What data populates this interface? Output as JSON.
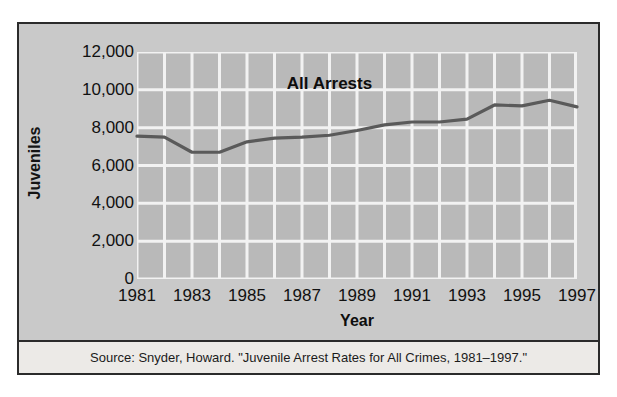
{
  "figure": {
    "series_label": "All Arrests",
    "y_axis_title": "Juveniles",
    "x_axis_title": "Year",
    "source_note": "Source: Snyder, Howard. \"Juvenile Arrest Rates for All Crimes, 1981–1997.\"",
    "colors": {
      "panel_background": "#c9c9c9",
      "plot_background": "#b9b9b9",
      "gridline": "#f2f2f2",
      "line": "#5a5a5a",
      "frame_border": "#2b2b2b",
      "caption_background": "#eceae7",
      "text": "#111111"
    }
  },
  "chart_data": {
    "type": "line",
    "title": "",
    "subtitle": "",
    "xlabel": "Year",
    "ylabel": "Juveniles",
    "xlim": [
      1981,
      1997
    ],
    "ylim": [
      0,
      12000
    ],
    "grid": true,
    "legend_position": "inline-annotation",
    "y_ticks": [
      0,
      2000,
      4000,
      6000,
      8000,
      10000,
      12000
    ],
    "y_tick_labels": [
      "0",
      "2,000",
      "4,000",
      "6,000",
      "8,000",
      "10,000",
      "12,000"
    ],
    "x_ticks": [
      1981,
      1983,
      1985,
      1987,
      1989,
      1991,
      1993,
      1995,
      1997
    ],
    "x_tick_labels": [
      "1981",
      "1983",
      "1985",
      "1987",
      "1989",
      "1991",
      "1993",
      "1995",
      "1997"
    ],
    "x": [
      1981,
      1982,
      1983,
      1984,
      1985,
      1986,
      1987,
      1988,
      1989,
      1990,
      1991,
      1992,
      1993,
      1994,
      1995,
      1996,
      1997
    ],
    "series": [
      {
        "name": "All Arrests",
        "values": [
          7550,
          7500,
          6700,
          6700,
          7250,
          7450,
          7500,
          7600,
          7850,
          8150,
          8300,
          8300,
          8450,
          9200,
          9150,
          9450,
          9100
        ]
      }
    ],
    "annotations": [
      {
        "text": "All Arrests",
        "x": 1988,
        "y": 10300
      }
    ]
  }
}
